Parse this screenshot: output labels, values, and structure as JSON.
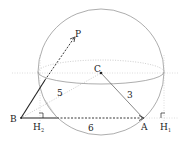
{
  "diagram": {
    "type": "geometry-sphere",
    "points": {
      "B": {
        "label": "B"
      },
      "A": {
        "label": "A"
      },
      "C": {
        "label": "C"
      },
      "P": {
        "label": "P"
      },
      "H1": {
        "label": "H",
        "sub": "1"
      },
      "H2": {
        "label": "H",
        "sub": "2"
      }
    },
    "lengths": {
      "BC": "5",
      "CA": "3",
      "BA": "6"
    },
    "colors": {
      "line": "#222222",
      "aux": "#999999"
    }
  }
}
